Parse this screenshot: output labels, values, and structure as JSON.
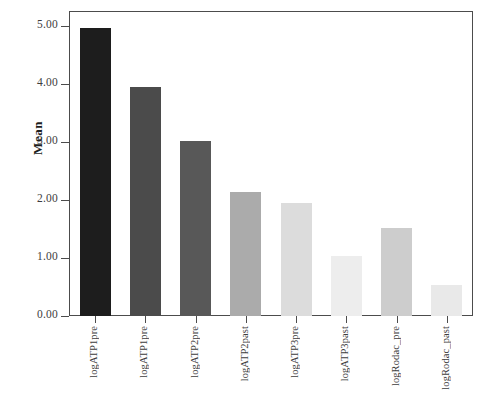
{
  "chart_data": {
    "type": "bar",
    "title": "",
    "subtitle": "",
    "xlabel": "",
    "ylabel": "Mean",
    "ylim": [
      0.0,
      5.25
    ],
    "yticks": [
      "0.00",
      "1.00",
      "2.00",
      "3.00",
      "4.00",
      "5.00"
    ],
    "ytick_values": [
      0.0,
      1.0,
      2.0,
      3.0,
      4.0,
      5.0
    ],
    "grid": false,
    "legend": "none",
    "categories": [
      "logATP1pre",
      "logATP1pre",
      "logATP2pre",
      "logATP2past",
      "logATP3pre",
      "logATP3past",
      "logRodac_pre",
      "logRodac_past"
    ],
    "values": [
      4.98,
      3.95,
      3.02,
      2.15,
      1.96,
      1.04,
      1.52,
      0.54
    ],
    "bar_colors": [
      "#1d1d1d",
      "#4b4b4b",
      "#585858",
      "#ababab",
      "#dcdcdc",
      "#ededed",
      "#cdcdcd",
      "#e9e9e9"
    ]
  },
  "axes": {
    "frame_color": "#4c4c4c",
    "text_color": "#3d3d3d"
  }
}
